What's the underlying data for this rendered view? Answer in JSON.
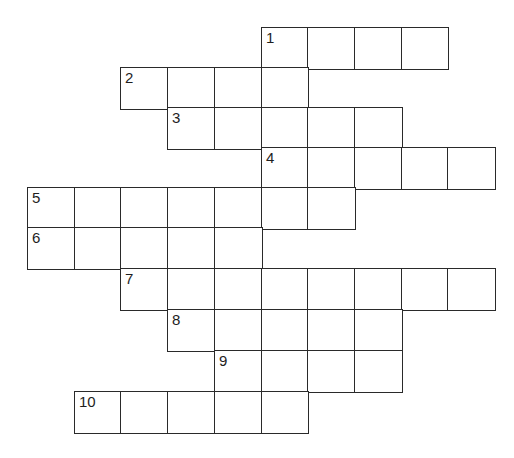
{
  "puzzle": {
    "type": "crossword",
    "layout": {
      "origin_x": 27,
      "cell_width": 46.7,
      "row_tops": [
        27,
        67,
        107,
        147,
        187,
        227,
        268,
        309,
        350,
        391
      ],
      "row_height": 40.8,
      "border_color": "#2a2a2a",
      "cell_color": "#ffffff"
    },
    "entries": [
      {
        "number": "1",
        "start_col": 5,
        "length": 4
      },
      {
        "number": "2",
        "start_col": 2,
        "length": 4
      },
      {
        "number": "3",
        "start_col": 3,
        "length": 5
      },
      {
        "number": "4",
        "start_col": 5,
        "length": 5
      },
      {
        "number": "5",
        "start_col": 0,
        "length": 7
      },
      {
        "number": "6",
        "start_col": 0,
        "length": 5
      },
      {
        "number": "7",
        "start_col": 2,
        "length": 8
      },
      {
        "number": "8",
        "start_col": 3,
        "length": 5
      },
      {
        "number": "9",
        "start_col": 4,
        "length": 4
      },
      {
        "number": "10",
        "start_col": 1,
        "length": 5
      }
    ]
  }
}
